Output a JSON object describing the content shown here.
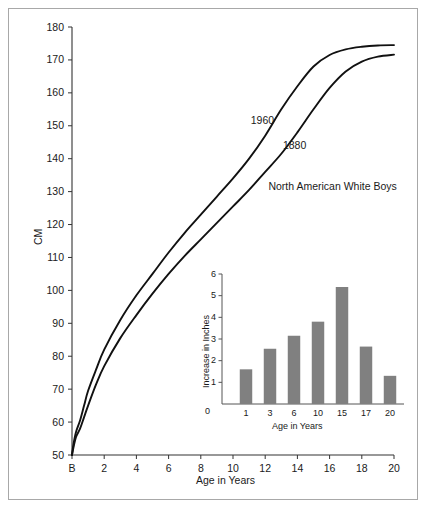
{
  "figure": {
    "background_color": "#ffffff",
    "frame_color": "#a8a8a8",
    "line_color": "#111111",
    "bar_color": "#808080",
    "axis_color": "#333333"
  },
  "chart_data": [
    {
      "type": "line",
      "title": "",
      "xlabel": "Age in Years",
      "ylabel": "CM",
      "xlim": [
        0,
        20
      ],
      "ylim": [
        50,
        180
      ],
      "grid": false,
      "legend_position": "inline-annotation",
      "xticklabels": [
        "B",
        "2",
        "4",
        "6",
        "8",
        "10",
        "12",
        "14",
        "16",
        "18",
        "20"
      ],
      "xtickvalues": [
        0,
        2,
        4,
        6,
        8,
        10,
        12,
        14,
        16,
        18,
        20
      ],
      "yticklabels": [
        "50",
        "60",
        "70",
        "80",
        "90",
        "100",
        "110",
        "120",
        "130",
        "140",
        "150",
        "160",
        "170",
        "180"
      ],
      "ytickvalues": [
        50,
        60,
        70,
        80,
        90,
        100,
        110,
        120,
        130,
        140,
        150,
        160,
        170,
        180
      ],
      "annotations": [
        {
          "text": "1960",
          "x": 11.1,
          "y": 151.5
        },
        {
          "text": "1880",
          "x": 13.1,
          "y": 144.0
        },
        {
          "text": "North American White Boys",
          "x": 12.2,
          "y": 131.5
        }
      ],
      "x": [
        0,
        0.1,
        0.25,
        0.5,
        0.75,
        1,
        1.5,
        2,
        3,
        4,
        5,
        6,
        7,
        8,
        9,
        10,
        11,
        12,
        13,
        14,
        15,
        16,
        17,
        18,
        19,
        20
      ],
      "series": [
        {
          "name": "1960",
          "values": [
            50,
            53.5,
            57,
            60.5,
            65,
            69.5,
            76,
            82,
            91,
            98.5,
            105,
            111.5,
            117.5,
            123,
            128.5,
            134,
            140,
            147,
            155,
            162,
            168,
            171.5,
            173.2,
            174,
            174.4,
            174.5
          ]
        },
        {
          "name": "1880",
          "values": [
            50,
            52.5,
            55.5,
            58,
            61.5,
            65,
            71.5,
            77,
            85.5,
            92.5,
            99,
            105,
            110.5,
            115.5,
            120.5,
            125.5,
            130.5,
            136,
            141.5,
            148,
            155,
            161.5,
            166.5,
            169.5,
            171,
            171.6
          ]
        }
      ]
    },
    {
      "type": "bar",
      "title": "",
      "xlabel": "Age in Years",
      "ylabel": "Increase in Inches",
      "xlim": [
        0,
        7.8
      ],
      "ylim": [
        0,
        6
      ],
      "grid": false,
      "origin_label": "0",
      "yticklabels": [
        "1",
        "2",
        "3",
        "4",
        "5",
        "6"
      ],
      "ytickvalues": [
        1,
        2,
        3,
        4,
        5,
        6
      ],
      "categories": [
        "1",
        "3",
        "6",
        "10",
        "15",
        "17",
        "20"
      ],
      "values": [
        1.6,
        2.55,
        3.15,
        3.8,
        5.4,
        2.65,
        1.3
      ]
    }
  ]
}
